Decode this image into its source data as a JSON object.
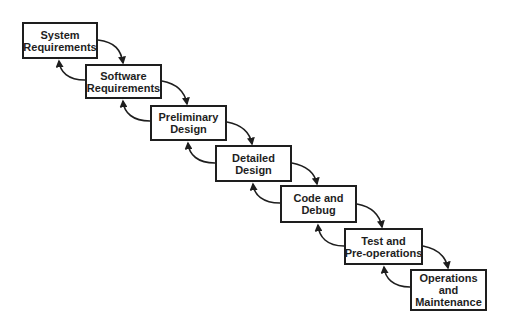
{
  "diagram": {
    "type": "waterfall-model",
    "stages": [
      {
        "id": "system-requirements",
        "lines": [
          "System",
          "Requirements"
        ],
        "x": 22,
        "y": 22,
        "w": 76,
        "h": 37
      },
      {
        "id": "software-requirements",
        "lines": [
          "Software",
          "Requirements"
        ],
        "x": 85,
        "y": 64,
        "w": 77,
        "h": 35
      },
      {
        "id": "preliminary-design",
        "lines": [
          "Preliminary",
          "Design"
        ],
        "x": 150,
        "y": 105,
        "w": 77,
        "h": 36
      },
      {
        "id": "detailed-design",
        "lines": [
          "Detailed",
          "Design"
        ],
        "x": 215,
        "y": 145,
        "w": 77,
        "h": 37
      },
      {
        "id": "code-and-debug",
        "lines": [
          "Code and",
          "Debug"
        ],
        "x": 280,
        "y": 185,
        "w": 77,
        "h": 38
      },
      {
        "id": "test-and-pre-operations",
        "lines": [
          "Test and",
          "Pre-operations"
        ],
        "x": 344,
        "y": 228,
        "w": 79,
        "h": 37
      },
      {
        "id": "operations-and-maintenance",
        "lines": [
          "Operations",
          "and",
          "Maintenance"
        ],
        "x": 410,
        "y": 269,
        "w": 77,
        "h": 42
      }
    ],
    "connections": "each stage has a forward arrow to the next stage and a feedback arrow from the next stage back to it",
    "colors": {
      "stroke": "#1e1e1e",
      "background": "#ffffff"
    }
  }
}
